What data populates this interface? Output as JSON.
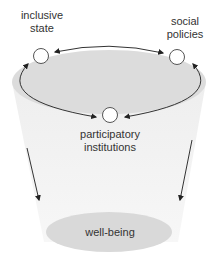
{
  "diagram": {
    "nodes": [
      {
        "id": "inclusive-state",
        "label_line1": "inclusive",
        "label_line2": "state"
      },
      {
        "id": "social-policies",
        "label_line1": "social",
        "label_line2": "policies"
      },
      {
        "id": "participatory-institutions",
        "label_line1": "participatory",
        "label_line2": "institutions"
      }
    ],
    "outcome": {
      "label": "well-being"
    },
    "colors": {
      "top_ellipse": "#dcdcdc",
      "cone": "#f2f2f2",
      "bottom_ellipse": "#d9d9d9",
      "stroke": "#333333",
      "node_fill": "#ffffff"
    }
  }
}
